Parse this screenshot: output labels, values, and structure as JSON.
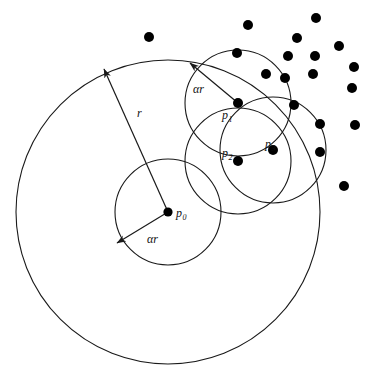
{
  "figure": {
    "type": "geometric-diagram",
    "title": "",
    "background_color": "#ffffff",
    "stroke_color": "#1a1a1a",
    "dot_color": "#000000",
    "width": 374,
    "height": 384
  },
  "labels": {
    "p0": {
      "base": "p",
      "sub": "0"
    },
    "p1": {
      "base": "p",
      "sub": "1"
    },
    "p2": {
      "base": "p",
      "sub": "2"
    },
    "p3": {
      "base": "p",
      "sub": "3"
    },
    "r": "r",
    "alpha_r_center": "αr",
    "alpha_r_p1": "αr"
  },
  "chart_data": {
    "type": "scatter",
    "title": "",
    "xlabel": "",
    "ylabel": "",
    "xlim": [
      0,
      374
    ],
    "ylim": [
      0,
      384
    ],
    "grid": false,
    "legend": null,
    "circles": [
      {
        "name": "outer-radius-r",
        "cx": 168,
        "cy": 212,
        "r": 152,
        "label": "r"
      },
      {
        "name": "center-alpha-r",
        "cx": 168,
        "cy": 212,
        "r": 53,
        "label": "αr"
      },
      {
        "name": "p1-alpha-r",
        "cx": 238,
        "cy": 103,
        "r": 53,
        "label": "αr"
      },
      {
        "name": "p2-alpha-r",
        "cx": 238,
        "cy": 161,
        "r": 53,
        "label": "αr"
      },
      {
        "name": "p3-alpha-r",
        "cx": 273,
        "cy": 150,
        "r": 53,
        "label": "αr"
      }
    ],
    "labeled_points": [
      {
        "id": "p0",
        "x": 168,
        "y": 212
      },
      {
        "id": "p1",
        "x": 238,
        "y": 103
      },
      {
        "id": "p2",
        "x": 238,
        "y": 161
      },
      {
        "id": "p3",
        "x": 273,
        "y": 150
      }
    ],
    "points": [
      {
        "x": 149,
        "y": 37
      },
      {
        "x": 248,
        "y": 25
      },
      {
        "x": 297,
        "y": 38
      },
      {
        "x": 316,
        "y": 18
      },
      {
        "x": 237,
        "y": 53
      },
      {
        "x": 288,
        "y": 56
      },
      {
        "x": 315,
        "y": 56
      },
      {
        "x": 339,
        "y": 46
      },
      {
        "x": 266,
        "y": 74
      },
      {
        "x": 285,
        "y": 78
      },
      {
        "x": 313,
        "y": 74
      },
      {
        "x": 354,
        "y": 67
      },
      {
        "x": 352,
        "y": 88
      },
      {
        "x": 294,
        "y": 105
      },
      {
        "x": 320,
        "y": 124
      },
      {
        "x": 355,
        "y": 125
      },
      {
        "x": 320,
        "y": 152
      },
      {
        "x": 344,
        "y": 186
      }
    ],
    "arrows": [
      {
        "name": "r-arrow",
        "x1": 168,
        "y1": 212,
        "x2": 104,
        "y2": 69,
        "label": "r",
        "label_x": 137,
        "label_y": 117
      },
      {
        "name": "alpha-r-arrow",
        "x1": 168,
        "y1": 212,
        "x2": 117,
        "y2": 243,
        "label": "αr",
        "label_x": 147,
        "label_y": 243
      },
      {
        "name": "alpha-r-p1-arrow",
        "x1": 238,
        "y1": 103,
        "x2": 190,
        "y2": 63,
        "label": "αr",
        "label_x": 193,
        "label_y": 93
      }
    ]
  }
}
